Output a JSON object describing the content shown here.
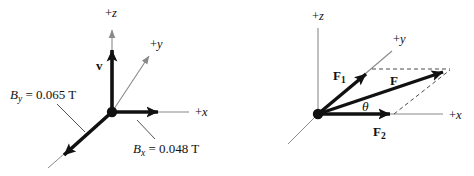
{
  "figure": {
    "background_color": "#ffffff",
    "axis_color": "#8a8a8a",
    "vector_color": "#111111",
    "dashed_color": "#4a4a4a",
    "panels": [
      {
        "id": "left-panel",
        "name": "magnetic-field-vector-diagram",
        "origin": {
          "x": 112,
          "y": 112
        },
        "axes": [
          {
            "name": "z-axis",
            "label_sign": "+",
            "label_var": "z",
            "label_x": 105,
            "label_y": 17
          },
          {
            "name": "y-axis",
            "label_sign": "+",
            "label_var": "y",
            "label_x": 150,
            "label_y": 48
          },
          {
            "name": "x-axis",
            "label_sign": "+",
            "label_var": "x",
            "label_x": 195,
            "label_y": 116
          }
        ],
        "vectors": [
          {
            "name": "velocity-vector",
            "label": "v",
            "sub": "",
            "label_x": 96,
            "label_y": 70
          },
          {
            "name": "bx-vector",
            "label": "",
            "sub": ""
          },
          {
            "name": "by-vector",
            "label": "",
            "sub": ""
          }
        ],
        "annotations": [
          {
            "name": "by-field-label",
            "var": "B",
            "sub": "y",
            "value": " = 0.065 T",
            "x": 10,
            "y": 99
          },
          {
            "name": "bx-field-label",
            "var": "B",
            "sub": "x",
            "value": " = 0.048 T",
            "x": 133,
            "y": 153
          }
        ]
      },
      {
        "id": "right-panel",
        "name": "force-vector-addition-diagram",
        "origin": {
          "x": 318,
          "y": 114
        },
        "axes": [
          {
            "name": "z-axis",
            "label_sign": "+",
            "label_var": "z",
            "label_x": 312,
            "label_y": 20
          },
          {
            "name": "y-axis",
            "label_sign": "+",
            "label_var": "y",
            "label_x": 393,
            "label_y": 43
          },
          {
            "name": "x-axis",
            "label_sign": "+",
            "label_var": "x",
            "label_x": 449,
            "label_y": 119
          }
        ],
        "vectors": [
          {
            "name": "f1-vector",
            "label": "F",
            "sub": "1",
            "label_x": 335,
            "label_y": 80
          },
          {
            "name": "f-resultant-vector",
            "label": "F",
            "sub": "",
            "label_x": 392,
            "label_y": 85
          },
          {
            "name": "f2-vector",
            "label": "F",
            "sub": "2",
            "label_x": 376,
            "label_y": 136
          }
        ],
        "annotations": [
          {
            "name": "theta-angle-label",
            "symbol": "θ",
            "x": 365,
            "y": 113
          }
        ]
      }
    ]
  }
}
